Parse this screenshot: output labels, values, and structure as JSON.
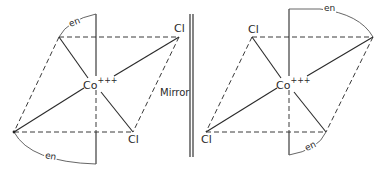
{
  "figure": {
    "mirror_label": "Mirror",
    "left_isomer": {
      "metal": "Co",
      "charge": "+++",
      "ligands": {
        "cl_top": "Cl",
        "cl_bottom": "Cl",
        "en_top": "en",
        "en_bottom": "en"
      }
    },
    "right_isomer": {
      "metal": "Co",
      "charge": "+++",
      "ligands": {
        "cl_top": "Cl",
        "cl_bottom": "Cl",
        "en_top": "en",
        "en_bottom": "en"
      }
    }
  },
  "colors": {
    "line": "#2a2a2a",
    "background": "#ffffff"
  }
}
